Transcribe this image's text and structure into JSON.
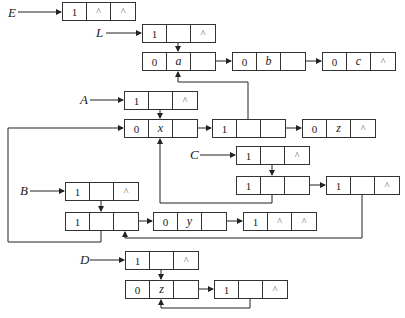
{
  "diagram": {
    "type": "generalized-list-storage-structure",
    "heads": [
      {
        "name": "E",
        "label": "E",
        "x": 8,
        "y": 6
      },
      {
        "name": "L",
        "label": "L",
        "x": 96,
        "y": 26
      },
      {
        "name": "A",
        "label": "A",
        "x": 80,
        "y": 93
      },
      {
        "name": "C",
        "label": "C",
        "x": 190,
        "y": 148
      },
      {
        "name": "B",
        "label": "B",
        "x": 20,
        "y": 184
      },
      {
        "name": "D",
        "label": "D",
        "x": 80,
        "y": 253
      }
    ],
    "nodes": [
      {
        "id": "E0",
        "x": 62,
        "y": 2,
        "cells": [
          "1",
          "^",
          "^"
        ]
      },
      {
        "id": "L0",
        "x": 142,
        "y": 24,
        "cells": [
          "1",
          "",
          "^"
        ]
      },
      {
        "id": "La",
        "x": 142,
        "y": 52,
        "cells": [
          "0",
          "a",
          ""
        ]
      },
      {
        "id": "Lb",
        "x": 232,
        "y": 52,
        "cells": [
          "0",
          "b",
          ""
        ]
      },
      {
        "id": "Lc",
        "x": 322,
        "y": 52,
        "cells": [
          "0",
          "c",
          "^"
        ]
      },
      {
        "id": "A0",
        "x": 124,
        "y": 91,
        "cells": [
          "1",
          "",
          "^"
        ]
      },
      {
        "id": "Ax",
        "x": 124,
        "y": 119,
        "cells": [
          "0",
          "x",
          ""
        ]
      },
      {
        "id": "A1",
        "x": 212,
        "y": 119,
        "cells": [
          "1",
          "",
          ""
        ]
      },
      {
        "id": "Az",
        "x": 302,
        "y": 119,
        "cells": [
          "0",
          "z",
          "^"
        ]
      },
      {
        "id": "C0",
        "x": 236,
        "y": 146,
        "cells": [
          "1",
          "",
          "^"
        ]
      },
      {
        "id": "C1",
        "x": 236,
        "y": 176,
        "cells": [
          "1",
          "",
          ""
        ]
      },
      {
        "id": "C2",
        "x": 326,
        "y": 176,
        "cells": [
          "1",
          "",
          "^"
        ]
      },
      {
        "id": "B0",
        "x": 65,
        "y": 182,
        "cells": [
          "1",
          "",
          "^"
        ]
      },
      {
        "id": "B1",
        "x": 65,
        "y": 212,
        "cells": [
          "1",
          "",
          ""
        ]
      },
      {
        "id": "By",
        "x": 153,
        "y": 212,
        "cells": [
          "0",
          "y",
          ""
        ]
      },
      {
        "id": "B2",
        "x": 243,
        "y": 212,
        "cells": [
          "1",
          "^",
          "^"
        ]
      },
      {
        "id": "D0",
        "x": 125,
        "y": 251,
        "cells": [
          "1",
          "",
          "^"
        ]
      },
      {
        "id": "Dz",
        "x": 125,
        "y": 280,
        "cells": [
          "0",
          "z",
          ""
        ]
      },
      {
        "id": "D1",
        "x": 214,
        "y": 280,
        "cells": [
          "1",
          "",
          "^"
        ]
      }
    ]
  }
}
